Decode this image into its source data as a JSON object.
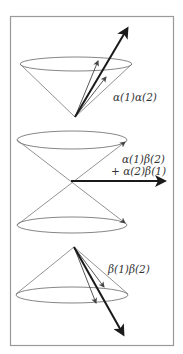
{
  "figure": {
    "frame_color": "#9a9a9a",
    "line_color": "#555555",
    "arrow_color": "#1a1a1a",
    "cones": [
      {
        "name": "alpha-alpha",
        "label_lines": [
          "α(1)α(2)"
        ],
        "orientation": "up"
      },
      {
        "name": "alpha-beta-plus-beta-alpha",
        "label_lines": [
          "α(1)β(2)",
          "+ α(2)β(1)"
        ],
        "orientation": "double"
      },
      {
        "name": "beta-beta",
        "label_lines": [
          "β(1)β(2)"
        ],
        "orientation": "down"
      }
    ]
  }
}
